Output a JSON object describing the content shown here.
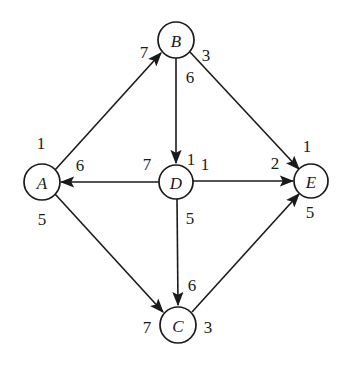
{
  "diagram": {
    "background_color": "#ffffff",
    "stroke_color": "#1a1a1a",
    "nodes": [
      {
        "id": "A",
        "label": "A",
        "cx": 42,
        "cy": 182,
        "r": 18
      },
      {
        "id": "B",
        "label": "B",
        "cx": 176,
        "cy": 40,
        "r": 18
      },
      {
        "id": "C",
        "label": "C",
        "cx": 178,
        "cy": 325,
        "r": 18
      },
      {
        "id": "D",
        "label": "D",
        "cx": 176,
        "cy": 182,
        "r": 17
      },
      {
        "id": "E",
        "label": "E",
        "cx": 311,
        "cy": 181,
        "r": 17
      }
    ],
    "edges": [
      {
        "from": "A",
        "to": "B",
        "tail_weight": "1",
        "head_weight": "7",
        "x1": 55,
        "y1": 170,
        "x2": 161,
        "y2": 53,
        "tail_label_x": 41,
        "tail_label_y": 143,
        "head_label_x": 144,
        "head_label_y": 52
      },
      {
        "from": "B",
        "to": "E",
        "tail_weight": "3",
        "head_weight": "1",
        "x1": 190,
        "y1": 52,
        "x2": 299,
        "y2": 169,
        "tail_label_x": 206,
        "tail_label_y": 55,
        "head_label_x": 307,
        "head_label_y": 146
      },
      {
        "from": "B",
        "to": "D",
        "tail_weight": "6",
        "head_weight": "1",
        "x1": 176,
        "y1": 58,
        "x2": 176,
        "y2": 163,
        "tail_label_x": 190,
        "tail_label_y": 77,
        "head_label_x": 191,
        "head_label_y": 159
      },
      {
        "from": "D",
        "to": "A",
        "tail_weight": "7",
        "head_weight": "6",
        "x1": 159,
        "y1": 182,
        "x2": 61,
        "y2": 182,
        "tail_label_x": 147,
        "tail_label_y": 164,
        "head_label_x": 80,
        "head_label_y": 165
      },
      {
        "from": "D",
        "to": "E",
        "tail_weight": "1",
        "head_weight": "2",
        "x1": 193,
        "y1": 181,
        "x2": 293,
        "y2": 181,
        "tail_label_x": 205,
        "tail_label_y": 164,
        "head_label_x": 275,
        "head_label_y": 163
      },
      {
        "from": "D",
        "to": "C",
        "tail_weight": "5",
        "head_weight": "6",
        "x1": 177,
        "y1": 199,
        "x2": 178,
        "y2": 305,
        "tail_label_x": 190,
        "tail_label_y": 218,
        "head_label_x": 192,
        "head_label_y": 285
      },
      {
        "from": "A",
        "to": "C",
        "tail_weight": "5",
        "head_weight": "7",
        "x1": 55,
        "y1": 194,
        "x2": 163,
        "y2": 312,
        "tail_label_x": 42,
        "tail_label_y": 219,
        "head_label_x": 147,
        "head_label_y": 327
      },
      {
        "from": "C",
        "to": "E",
        "tail_weight": "3",
        "head_weight": "5",
        "x1": 192,
        "y1": 312,
        "x2": 299,
        "y2": 194,
        "tail_label_x": 208,
        "tail_label_y": 327,
        "head_label_x": 310,
        "head_label_y": 212
      }
    ]
  }
}
